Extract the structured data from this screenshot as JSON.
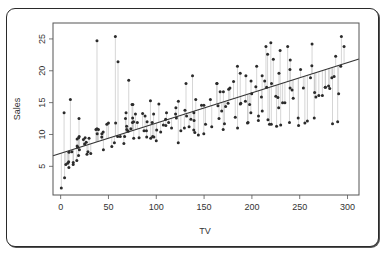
{
  "chart_data": {
    "type": "scatter",
    "title": "",
    "xlabel": "TV",
    "ylabel": "Sales",
    "xlim": [
      -8,
      312
    ],
    "ylim": [
      0.5,
      27.5
    ],
    "xticks": [
      0,
      50,
      100,
      150,
      200,
      250,
      300
    ],
    "yticks": [
      5,
      10,
      15,
      20,
      25
    ],
    "grid": false,
    "legend": null,
    "fit_line": {
      "intercept": 7.03,
      "slope": 0.0475,
      "x_range": [
        -8,
        312
      ],
      "color": "#333333"
    },
    "residual_segments": true,
    "colors": {
      "points": "#2b2b2b",
      "residuals": "#b8b8b8",
      "axis": "#555555",
      "frame": "#555555"
    },
    "x": [
      0.7,
      4.1,
      5.4,
      7.3,
      8.4,
      8.6,
      8.7,
      11.7,
      13.1,
      13.2,
      16.9,
      17.2,
      17.2,
      17.9,
      18.7,
      18.8,
      19.4,
      19.6,
      23.8,
      25.1,
      25.6,
      26.8,
      27.5,
      28.6,
      29.7,
      31.5,
      36.9,
      38.0,
      38.2,
      39.5,
      43.0,
      43.1,
      44.5,
      44.7,
      48.3,
      53.5,
      56.2,
      57.5,
      59.6,
      62.3,
      66.1,
      66.9,
      67.8,
      68.4,
      69.0,
      69.2,
      70.6,
      73.4,
      74.7,
      75.1,
      75.3,
      75.5,
      76.3,
      76.4,
      78.2,
      80.2,
      85.7,
      87.2,
      88.3,
      89.7,
      90.4,
      93.9,
      94.2,
      95.7,
      96.2,
      97.2,
      97.5,
      100.4,
      102.7,
      104.6,
      107.4,
      109.8,
      110.7,
      112.9,
      116.0,
      120.2,
      120.5,
      121.0,
      123.1,
      125.7,
      129.4,
      131.1,
      131.7,
      134.3,
      136.2,
      137.9,
      139.2,
      139.3,
      139.5,
      140.3,
      141.3,
      147.3,
      149.7,
      149.8,
      151.5,
      156.6,
      163.3,
      163.5,
      164.5,
      165.6,
      166.8,
      168.4,
      170.2,
      171.3,
      172.5,
      175.1,
      175.7,
      177.0,
      180.8,
      182.6,
      184.9,
      187.8,
      187.9,
      188.4,
      193.2,
      193.7,
      195.4,
      197.6,
      198.9,
      199.1,
      199.8,
      204.1,
      205.0,
      206.8,
      206.9,
      210.7,
      210.8,
      213.4,
      214.7,
      215.4,
      216.4,
      216.8,
      218.4,
      219.8,
      220.3,
      220.5,
      222.4,
      225.8,
      227.2,
      228.0,
      228.3,
      229.5,
      230.1,
      232.1,
      234.5,
      237.4,
      239.3,
      239.8,
      239.9,
      240.1,
      243.2,
      248.4,
      248.8,
      250.9,
      253.8,
      255.4,
      261.3,
      262.7,
      262.9,
      265.2,
      265.6,
      266.9,
      273.7,
      276.7,
      276.9,
      280.2,
      281.4,
      283.6,
      284.3,
      286.0,
      287.6,
      289.7,
      290.7,
      292.9,
      293.6,
      296.4,
      3.6,
      10.2,
      19.2,
      38.0,
      50.0,
      57.2,
      60.0,
      71.2,
      82.0,
      90.0,
      100.0,
      110.0,
      123.0,
      130.0,
      144.0,
      158.0,
      170.0,
      185.0,
      196.0,
      210.0,
      225.0,
      242.0,
      258.0,
      270.0
    ],
    "y": [
      1.6,
      3.2,
      5.3,
      5.5,
      5.7,
      4.8,
      7.2,
      7.3,
      5.3,
      5.6,
      5.9,
      8.2,
      9.3,
      8.0,
      6.7,
      9.5,
      9.7,
      7.6,
      9.2,
      8.5,
      9.5,
      8.8,
      6.9,
      7.3,
      9.4,
      7.0,
      10.8,
      10.9,
      10.1,
      10.8,
      9.6,
      10.1,
      10.4,
      7.6,
      11.6,
      8.1,
      8.7,
      11.8,
      9.7,
      9.7,
      8.6,
      9.7,
      12.5,
      13.4,
      11.3,
      10.8,
      10.5,
      10.9,
      14.7,
      11.9,
      12.6,
      14.7,
      12.0,
      9.4,
      13.2,
      11.9,
      13.3,
      10.6,
      12.9,
      10.6,
      12.0,
      15.3,
      9.4,
      11.9,
      9.7,
      13.2,
      9.6,
      10.7,
      14.8,
      10.4,
      11.5,
      12.4,
      13.4,
      11.9,
      11.0,
      13.2,
      14.2,
      12.6,
      15.2,
      10.6,
      11.0,
      18.0,
      12.9,
      11.2,
      12.4,
      19.2,
      10.7,
      13.4,
      12.2,
      10.3,
      15.5,
      14.6,
      10.1,
      14.6,
      11.6,
      15.5,
      18.0,
      18.0,
      14.5,
      12.5,
      16.7,
      13.7,
      16.7,
      11.7,
      14.4,
      14.9,
      17.1,
      17.3,
      18.3,
      12.7,
      20.7,
      19.6,
      14.8,
      14.9,
      15.2,
      19.2,
      11.8,
      14.7,
      13.4,
      18.4,
      16.4,
      17.5,
      20.7,
      12.2,
      12.9,
      19.2,
      13.7,
      18.4,
      23.8,
      17.4,
      22.6,
      12.3,
      11.6,
      24.4,
      11.6,
      18.0,
      21.8,
      11.3,
      15.8,
      14.2,
      19.6,
      23.2,
      11.5,
      15.0,
      15.0,
      23.8,
      11.9,
      20.2,
      17.3,
      21.7,
      15.7,
      12.6,
      11.4,
      20.2,
      17.3,
      11.8,
      18.9,
      20.8,
      24.2,
      12.6,
      16.6,
      15.9,
      16.1,
      17.4,
      17.4,
      17.6,
      17.2,
      18.9,
      11.7,
      19.1,
      22.3,
      12.0,
      16.4,
      20.7,
      25.4,
      23.8,
      13.4,
      15.5,
      12.5,
      24.7,
      11.8,
      25.4,
      21.4,
      18.5,
      9.5,
      9.6,
      9.0,
      11.4,
      8.7,
      13.8,
      9.9,
      11.2,
      10.8,
      11.0,
      11.9,
      15.9,
      16.0,
      17.0,
      12.1,
      16.1,
      15.2,
      20.9,
      18.0,
      14.9,
      25.4,
      16.8,
      26.0
    ]
  }
}
